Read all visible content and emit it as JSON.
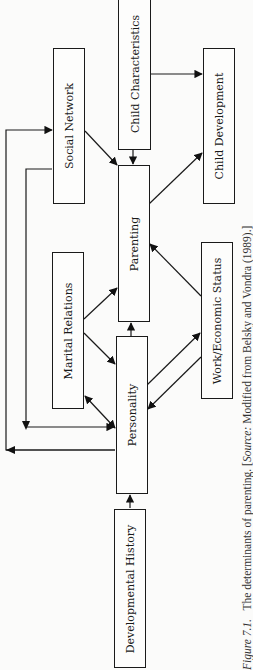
{
  "diagram": {
    "title": "The determinants of parenting",
    "orientation": "rotated-90-ccw",
    "boxes": {
      "child_characteristics": "Child Characteristics",
      "social_network": "Social Network",
      "child_development": "Child Development",
      "parenting": "Parenting",
      "marital_relations": "Marital Relations",
      "work_economic_status": "Work/Economic Status",
      "personality": "Personality",
      "developmental_history": "Developmental History"
    },
    "edges": [
      {
        "from": "Developmental History",
        "to": "Personality"
      },
      {
        "from": "Personality",
        "to": "Parenting"
      },
      {
        "from": "Personality",
        "to": "Work/Economic Status"
      },
      {
        "from": "Work/Economic Status",
        "to": "Personality"
      },
      {
        "from": "Work/Economic Status",
        "to": "Parenting"
      },
      {
        "from": "Personality",
        "to": "Marital Relations"
      },
      {
        "from": "Marital Relations",
        "to": "Personality"
      },
      {
        "from": "Marital Relations",
        "to": "Parenting"
      },
      {
        "from": "Personality",
        "to": "Social Network"
      },
      {
        "from": "Social Network",
        "to": "Personality"
      },
      {
        "from": "Social Network",
        "to": "Parenting"
      },
      {
        "from": "Child Characteristics",
        "to": "Parenting"
      },
      {
        "from": "Child Characteristics",
        "to": "Child Development"
      },
      {
        "from": "Parenting",
        "to": "Child Development"
      }
    ]
  },
  "caption": {
    "figure_label": "Figure 7.1.",
    "text": "The determinants of parenting.",
    "source_open": "[",
    "source_label": "Source:",
    "source_text": "Modified from Belsky and Vondra (1989).]"
  }
}
